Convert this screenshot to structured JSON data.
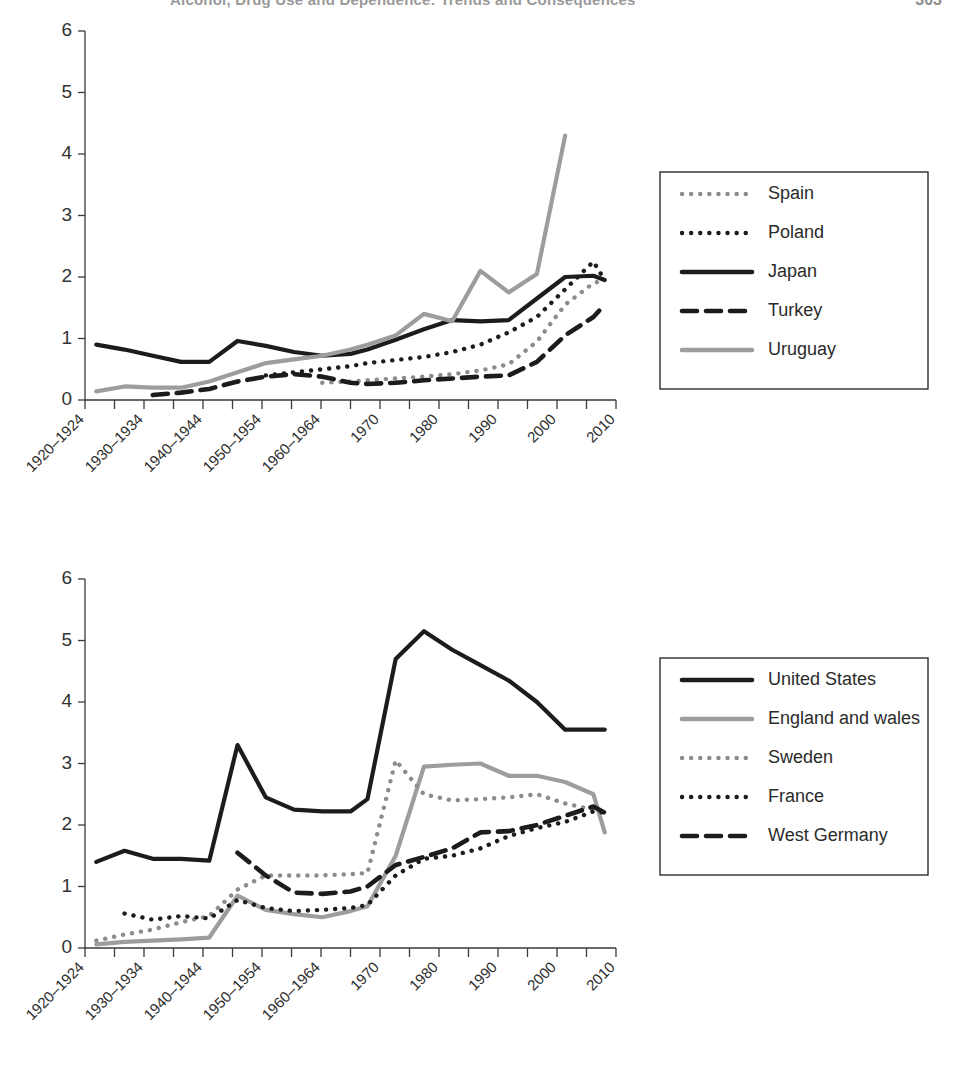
{
  "header": {
    "running_title": "Alcohol, Drug Use and Dependence: Trends and Consequences",
    "page_number": "303"
  },
  "figures": [
    {
      "id": "figure-1",
      "name": "chart-top",
      "chart_data": {
        "type": "line",
        "title": "",
        "xlabel": "",
        "ylabel": "",
        "ylim": [
          0,
          6
        ],
        "yticks": [
          0,
          1,
          2,
          3,
          4,
          5,
          6
        ],
        "grid": false,
        "legend_position": "right",
        "x": [
          1922,
          1927,
          1932,
          1937,
          1942,
          1947,
          1952,
          1957,
          1962,
          1967,
          1970,
          1975,
          1980,
          1985,
          1990,
          1995,
          2000,
          2005,
          2010,
          2012
        ],
        "categories": [
          "1920–1924",
          "1930–1934",
          "1940–1944",
          "1950–1954",
          "1960–1964",
          "1970",
          "1980",
          "1990",
          "2000",
          "2010"
        ],
        "series": [
          {
            "name": "Spain",
            "style": "dotted",
            "color": "#8c8c8c",
            "x": [
              1962,
              1967,
              1970,
              1975,
              1980,
              1985,
              1990,
              1995,
              2000,
              2005,
              2010,
              2012
            ],
            "values": [
              0.28,
              0.3,
              0.32,
              0.35,
              0.38,
              0.42,
              0.48,
              0.58,
              0.95,
              1.55,
              1.9,
              1.95
            ]
          },
          {
            "name": "Poland",
            "style": "dotted",
            "color": "#1c1c1c",
            "x": [
              1952,
              1957,
              1962,
              1967,
              1970,
              1975,
              1980,
              1985,
              1990,
              1995,
              2000,
              2005,
              2010,
              2012
            ],
            "values": [
              0.4,
              0.45,
              0.5,
              0.55,
              0.6,
              0.65,
              0.7,
              0.78,
              0.9,
              1.1,
              1.35,
              1.8,
              2.25,
              1.95
            ]
          },
          {
            "name": "Japan",
            "style": "solid",
            "color": "#1c1c1c",
            "x": [
              1922,
              1927,
              1932,
              1937,
              1942,
              1947,
              1952,
              1957,
              1962,
              1967,
              1970,
              1975,
              1980,
              1985,
              1990,
              1995,
              2000,
              2005,
              2010,
              2012
            ],
            "values": [
              0.9,
              0.82,
              0.72,
              0.62,
              0.62,
              0.96,
              0.88,
              0.78,
              0.72,
              0.75,
              0.82,
              0.98,
              1.15,
              1.3,
              1.28,
              1.3,
              1.65,
              2.0,
              2.02,
              1.95
            ]
          },
          {
            "name": "Turkey",
            "style": "dashed",
            "color": "#1c1c1c",
            "x": [
              1932,
              1937,
              1942,
              1947,
              1952,
              1957,
              1962,
              1967,
              1970,
              1975,
              1980,
              1985,
              1990,
              1995,
              2000,
              2005,
              2010,
              2012
            ],
            "values": [
              0.08,
              0.12,
              0.18,
              0.3,
              0.38,
              0.42,
              0.38,
              0.28,
              0.26,
              0.28,
              0.32,
              0.35,
              0.38,
              0.4,
              0.62,
              1.05,
              1.35,
              1.55
            ]
          },
          {
            "name": "Uruguay",
            "style": "solid",
            "color": "#9d9d9d",
            "x": [
              1922,
              1927,
              1932,
              1937,
              1942,
              1947,
              1952,
              1957,
              1962,
              1967,
              1970,
              1975,
              1980,
              1985,
              1990,
              1995,
              2000,
              2005
            ],
            "values": [
              0.14,
              0.22,
              0.2,
              0.2,
              0.3,
              0.45,
              0.6,
              0.66,
              0.72,
              0.82,
              0.9,
              1.05,
              1.4,
              1.28,
              2.1,
              1.75,
              2.05,
              4.3
            ]
          }
        ]
      },
      "legend": [
        {
          "label": "Spain",
          "style": "dotted",
          "color": "#8c8c8c"
        },
        {
          "label": "Poland",
          "style": "dotted",
          "color": "#1c1c1c"
        },
        {
          "label": "Japan",
          "style": "solid",
          "color": "#1c1c1c"
        },
        {
          "label": "Turkey",
          "style": "dashed",
          "color": "#1c1c1c"
        },
        {
          "label": "Uruguay",
          "style": "solid",
          "color": "#9d9d9d"
        }
      ]
    },
    {
      "id": "figure-2",
      "name": "chart-bottom",
      "chart_data": {
        "type": "line",
        "title": "",
        "xlabel": "",
        "ylabel": "",
        "ylim": [
          0,
          6
        ],
        "yticks": [
          0,
          1,
          2,
          3,
          4,
          5,
          6
        ],
        "grid": false,
        "legend_position": "right",
        "categories": [
          "1920–1924",
          "1930–1934",
          "1940–1944",
          "1950–1954",
          "1960–1964",
          "1970",
          "1980",
          "1990",
          "2000",
          "2010"
        ],
        "series": [
          {
            "name": "United States",
            "style": "solid",
            "color": "#1c1c1c",
            "x": [
              1922,
              1927,
              1932,
              1937,
              1942,
              1947,
              1952,
              1957,
              1962,
              1967,
              1970,
              1975,
              1980,
              1985,
              1990,
              1995,
              2000,
              2005,
              2010,
              2012
            ],
            "values": [
              1.4,
              1.58,
              1.45,
              1.45,
              1.42,
              3.3,
              2.45,
              2.25,
              2.22,
              2.22,
              2.42,
              4.7,
              5.15,
              4.85,
              4.6,
              4.35,
              4.0,
              3.55,
              3.55,
              3.55
            ]
          },
          {
            "name": "England and wales",
            "style": "solid",
            "color": "#9d9d9d",
            "x": [
              1922,
              1927,
              1932,
              1937,
              1942,
              1947,
              1952,
              1957,
              1962,
              1967,
              1970,
              1975,
              1980,
              1985,
              1990,
              1995,
              2000,
              2005,
              2010,
              2012
            ],
            "values": [
              0.06,
              0.1,
              0.12,
              0.14,
              0.17,
              0.85,
              0.62,
              0.55,
              0.5,
              0.6,
              0.68,
              1.5,
              2.95,
              2.98,
              3.0,
              2.8,
              2.8,
              2.7,
              2.5,
              1.88
            ]
          },
          {
            "name": "Sweden",
            "style": "dotted",
            "color": "#8c8c8c",
            "x": [
              1922,
              1927,
              1932,
              1937,
              1942,
              1947,
              1952,
              1957,
              1962,
              1967,
              1970,
              1975,
              1980,
              1985,
              1990,
              1995,
              2000,
              2005,
              2010,
              2012
            ],
            "values": [
              0.12,
              0.22,
              0.3,
              0.42,
              0.52,
              0.95,
              1.18,
              1.18,
              1.18,
              1.2,
              1.22,
              3.05,
              2.5,
              2.4,
              2.42,
              2.45,
              2.5,
              2.35,
              2.25,
              2.2
            ]
          },
          {
            "name": "France",
            "style": "dotted",
            "color": "#1c1c1c",
            "x": [
              1927,
              1932,
              1937,
              1942,
              1947,
              1952,
              1957,
              1962,
              1967,
              1970,
              1975,
              1980,
              1985,
              1990,
              1995,
              2000,
              2005,
              2010,
              2012
            ],
            "values": [
              0.56,
              0.46,
              0.52,
              0.48,
              0.78,
              0.65,
              0.6,
              0.62,
              0.65,
              0.7,
              1.18,
              1.45,
              1.5,
              1.62,
              1.82,
              1.95,
              2.05,
              2.22,
              2.2
            ]
          },
          {
            "name": "West Germany",
            "style": "dashed",
            "color": "#1c1c1c",
            "x": [
              1947,
              1952,
              1957,
              1962,
              1967,
              1970,
              1975,
              1980,
              1985,
              1990,
              1995,
              2000,
              2005,
              2010,
              2012
            ],
            "values": [
              1.55,
              1.18,
              0.9,
              0.88,
              0.92,
              1.0,
              1.35,
              1.48,
              1.62,
              1.88,
              1.9,
              2.0,
              2.15,
              2.3,
              2.2
            ]
          }
        ]
      },
      "legend": [
        {
          "label": "United States",
          "style": "solid",
          "color": "#1c1c1c"
        },
        {
          "label": "England and wales",
          "style": "solid",
          "color": "#9d9d9d"
        },
        {
          "label": "Sweden",
          "style": "dotted",
          "color": "#8c8c8c"
        },
        {
          "label": "France",
          "style": "dotted",
          "color": "#1c1c1c"
        },
        {
          "label": "West Germany",
          "style": "dashed",
          "color": "#1c1c1c"
        }
      ]
    }
  ]
}
